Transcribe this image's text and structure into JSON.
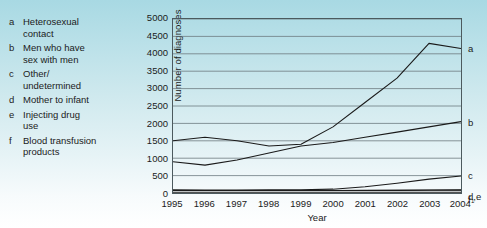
{
  "legend": {
    "items": [
      {
        "key": "a",
        "label": "Heterosexual\ncontact"
      },
      {
        "key": "b",
        "label": "Men who have\nsex with men"
      },
      {
        "key": "c",
        "label": "Other/\nundetermined"
      },
      {
        "key": "d",
        "label": "Mother to infant"
      },
      {
        "key": "e",
        "label": "Injecting drug\nuse"
      },
      {
        "key": "f",
        "label": "Blood transfusion\nproducts"
      }
    ]
  },
  "series_labels": {
    "a": "a",
    "b": "b",
    "c": "c",
    "de": "d,e",
    "f": "f"
  },
  "colors": {
    "line": "#1a1a1a",
    "grid": "#6d7b80",
    "frame": "#4c5a5e",
    "background_top": "#a8d9e3",
    "background_bottom": "#ffffff",
    "text": "#1b1b1b"
  },
  "chart_data": {
    "type": "line",
    "title": "",
    "xlabel": "Year",
    "ylabel": "Number of diagnoses",
    "x": [
      "1995",
      "1996",
      "1997",
      "1998",
      "1999",
      "2000",
      "2001",
      "2002",
      "2003",
      "2004"
    ],
    "x_tick_labels": [
      "1995",
      "1996",
      "1997",
      "1998",
      "1999",
      "2000",
      "2001",
      "2002",
      "2003",
      "2004¹"
    ],
    "xlim": [
      1995,
      2004
    ],
    "ylim": [
      0,
      5000
    ],
    "yticks": [
      0,
      500,
      1000,
      1500,
      2000,
      2500,
      3000,
      3500,
      4000,
      4500,
      5000
    ],
    "ytick_labels": [
      "0",
      "500",
      "1000",
      "1500",
      "2000",
      "2500",
      "3000",
      "3500",
      "4000",
      "4500",
      "5000"
    ],
    "grid": true,
    "legend_position": "left-outside",
    "series": [
      {
        "name": "a",
        "label": "Heterosexual contact",
        "values": [
          1500,
          1600,
          1500,
          1350,
          1400,
          1900,
          2600,
          3300,
          4300,
          4150
        ]
      },
      {
        "name": "b",
        "label": "Men who have sex with men",
        "values": [
          900,
          800,
          950,
          1150,
          1350,
          1450,
          1600,
          1750,
          1900,
          2050
        ]
      },
      {
        "name": "c",
        "label": "Other/undetermined",
        "values": [
          90,
          85,
          85,
          90,
          95,
          110,
          180,
          280,
          400,
          490
        ]
      },
      {
        "name": "d",
        "label": "Mother to infant",
        "values": [
          70,
          70,
          70,
          70,
          70,
          70,
          75,
          80,
          85,
          90
        ]
      },
      {
        "name": "e",
        "label": "Injecting drug use",
        "values": [
          70,
          70,
          70,
          70,
          70,
          70,
          72,
          75,
          78,
          80
        ]
      },
      {
        "name": "f",
        "label": "Blood transfusion products",
        "values": [
          20,
          20,
          20,
          20,
          20,
          20,
          20,
          20,
          20,
          20
        ]
      }
    ]
  }
}
